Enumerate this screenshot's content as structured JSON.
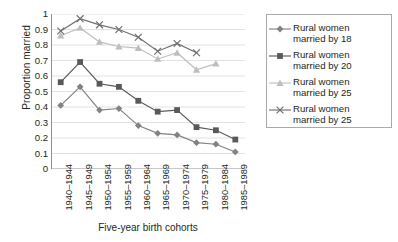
{
  "chart_data": {
    "type": "line",
    "title": "",
    "xlabel": "Five-year birth cohorts",
    "ylabel": "Proportion married",
    "categories": [
      "1940–1944",
      "1945–1949",
      "1950–1954",
      "1955–1959",
      "1960–1964",
      "1965–1969",
      "1970–1974",
      "1975–1979",
      "1980–1984",
      "1985–1989"
    ],
    "ylim": [
      0,
      1
    ],
    "yticks": [
      "0",
      "0.1",
      "0.2",
      "0.3",
      "0.4",
      "0.5",
      "0.6",
      "0.7",
      "0.8",
      "0.9",
      "1"
    ],
    "grid": "horizontal",
    "legend_position": "right",
    "series": [
      {
        "name": "Rural women married by 18",
        "marker": "diamond",
        "color": "#808285",
        "values": [
          0.41,
          0.53,
          0.38,
          0.39,
          0.28,
          0.23,
          0.22,
          0.17,
          0.16,
          0.11
        ]
      },
      {
        "name": "Rural women married by 20",
        "marker": "square",
        "color": "#58595b",
        "values": [
          0.56,
          0.69,
          0.55,
          0.53,
          0.44,
          0.37,
          0.38,
          0.27,
          0.25,
          0.19
        ]
      },
      {
        "name": "Rural women married by 25",
        "marker": "triangle",
        "color": "#bcbec0",
        "values": [
          0.86,
          0.91,
          0.82,
          0.79,
          0.78,
          0.71,
          0.75,
          0.64,
          0.68,
          null
        ]
      },
      {
        "name": "Rural women married by 25",
        "marker": "cross",
        "color": "#6d6e71",
        "values": [
          0.89,
          0.97,
          0.93,
          0.9,
          0.85,
          0.76,
          0.81,
          0.75,
          null,
          null
        ]
      }
    ]
  },
  "legend": {
    "entries": [
      "Rural women\nmarried by 18",
      "Rural women\nmarried by 20",
      "Rural women\nmarried by 25",
      "Rural women\nmarried by 25"
    ]
  }
}
